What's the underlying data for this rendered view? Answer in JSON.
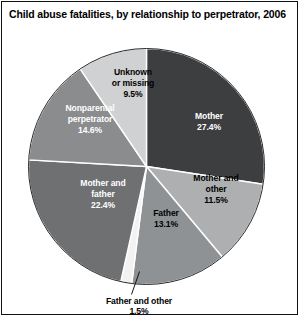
{
  "figure": {
    "title": "Child abuse fatalities, by relationship to perpetrator, 2006"
  },
  "chart_data": {
    "type": "pie",
    "title": "Child abuse fatalities, by relationship to perpetrator, 2006",
    "xlabel": "",
    "ylabel": "",
    "units": "percent",
    "start_angle_deg": 0,
    "direction": "clockwise",
    "legend": "none",
    "grid": false,
    "categories": [
      "Mother",
      "Mother and other",
      "Father",
      "Father and other",
      "Mother and father",
      "Nonparental perpetrator",
      "Unknown or missing"
    ],
    "values": [
      27.4,
      11.5,
      13.1,
      1.5,
      22.4,
      14.6,
      9.5
    ],
    "slices": [
      {
        "name": "Mother",
        "label_line1": "Mother",
        "label_line2": "27.4%",
        "value": 27.4,
        "value_text": "27.4%",
        "color": "#3d3e40",
        "text_color": "#ffffff",
        "label_placement": "inside"
      },
      {
        "name": "Mother and other",
        "label_line1": "Mother and",
        "label_line2": "other",
        "label_line3": "11.5%",
        "value": 11.5,
        "value_text": "11.5%",
        "color": "#adafb1",
        "text_color": "#000000",
        "label_placement": "inside"
      },
      {
        "name": "Father",
        "label_line1": "Father",
        "label_line2": "13.1%",
        "value": 13.1,
        "value_text": "13.1%",
        "color": "#8f9294",
        "text_color": "#000000",
        "label_placement": "inside"
      },
      {
        "name": "Father and other",
        "label_line1": "Father and other",
        "label_line2": "1.5%",
        "value": 1.5,
        "value_text": "1.5%",
        "color": "#f2f2f2",
        "text_color": "#000000",
        "label_placement": "callout"
      },
      {
        "name": "Mother and father",
        "label_line1": "Mother and",
        "label_line2": "father",
        "label_line3": "22.4%",
        "value": 22.4,
        "value_text": "22.4%",
        "color": "#6e7072",
        "text_color": "#ffffff",
        "label_placement": "inside"
      },
      {
        "name": "Nonparental perpetrator",
        "label_line1": "Nonparental",
        "label_line2": "perpetrator",
        "label_line3": "14.6%",
        "value": 14.6,
        "value_text": "14.6%",
        "color": "#8a8c8e",
        "text_color": "#ffffff",
        "label_placement": "inside"
      },
      {
        "name": "Unknown or missing",
        "label_line1": "Unknown",
        "label_line2": "or missing",
        "label_line3": "9.5%",
        "value": 9.5,
        "value_text": "9.5%",
        "color": "#cfd1d2",
        "text_color": "#000000",
        "label_placement": "inside"
      }
    ]
  }
}
